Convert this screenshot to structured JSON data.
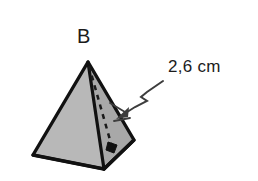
{
  "figure": {
    "kind": "geometry-diagram",
    "background_color": "#ffffff",
    "apex_label": "B",
    "measurement_label": "2,6 cm",
    "colors": {
      "face_left_fill": "#b4b4b4",
      "face_right_fill": "#a8a8a8",
      "outline": "#111111",
      "dashed_line": "#1a1a1a",
      "leader_line": "#3d3d3d",
      "text": "#1b1b1b"
    },
    "geometry": {
      "apex": [
        88,
        62
      ],
      "base_left": [
        33,
        155
      ],
      "base_front": [
        104,
        169
      ],
      "base_right": [
        134,
        140
      ],
      "hidden_base_back": [
        70,
        128
      ],
      "slant_height_foot": [
        112,
        148
      ]
    },
    "annotations": {
      "right_angle_marker": "right-angle-marker",
      "dashed_height": "slant-height-dashed-line",
      "leader": "zigzag-leader-line-with-arrowhead"
    }
  }
}
